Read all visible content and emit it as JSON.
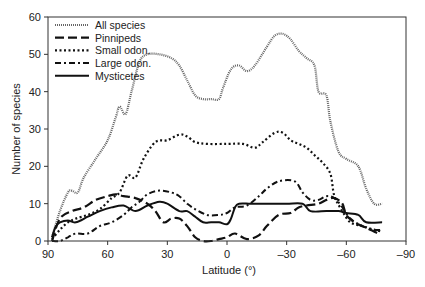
{
  "chart_data": {
    "type": "line",
    "title": "",
    "xlabel": "Latitude (°)",
    "ylabel": "Number of species",
    "xlim": [
      90,
      -90
    ],
    "ylim": [
      0,
      60
    ],
    "xticks": [
      90,
      60,
      30,
      0,
      -30,
      -60,
      -90
    ],
    "xtick_labels": [
      "90",
      "60",
      "30",
      "0",
      "–30",
      "–60",
      "–90"
    ],
    "yticks": [
      0,
      10,
      20,
      30,
      40,
      50,
      60
    ],
    "grid": false,
    "legend_position": "upper left",
    "series": [
      {
        "name": "All species",
        "style": "fine-dotted",
        "color": "#555555",
        "x": [
          88,
          84,
          80,
          78,
          75,
          72,
          66,
          60,
          56,
          54,
          51,
          48,
          44,
          40,
          34,
          28,
          24,
          20,
          16,
          12,
          8,
          4,
          2,
          -2,
          -6,
          -10,
          -14,
          -20,
          -24,
          -28,
          -32,
          -36,
          -40,
          -44,
          -46,
          -50,
          -52,
          -56,
          -60,
          -66,
          -70,
          -74,
          -78
        ],
        "y": [
          1,
          8,
          13,
          13.5,
          13,
          17,
          22,
          27,
          33,
          36,
          34,
          40,
          48,
          50,
          50,
          49,
          47,
          43,
          39,
          38,
          38,
          38,
          41,
          46,
          47,
          45.5,
          47,
          52,
          55,
          55.5,
          54,
          51,
          49,
          47,
          40,
          39,
          32,
          24,
          22,
          20,
          14,
          10,
          10
        ]
      },
      {
        "name": "Pinnipeds",
        "style": "dashed",
        "color": "#111111",
        "x": [
          88,
          84,
          78,
          72,
          66,
          60,
          56,
          52,
          46,
          40,
          36,
          32,
          28,
          24,
          20,
          16,
          12,
          8,
          4,
          0,
          -4,
          -10,
          -16,
          -20,
          -26,
          -32,
          -36,
          -40,
          -46,
          -50,
          -54,
          -58,
          -60,
          -64,
          -68,
          -72,
          -76
        ],
        "y": [
          0,
          6,
          8,
          9,
          11,
          12,
          12.5,
          12,
          11.5,
          10,
          8,
          5,
          6,
          6,
          4,
          1,
          0,
          0,
          0.5,
          1,
          2,
          0.5,
          1.5,
          4,
          7,
          7.5,
          9,
          9.5,
          10,
          11,
          11.5,
          10,
          7,
          5,
          4,
          3,
          2
        ]
      },
      {
        "name": "Small odon.",
        "style": "dotted",
        "color": "#111111",
        "x": [
          88,
          84,
          80,
          76,
          70,
          64,
          58,
          54,
          50,
          46,
          42,
          36,
          30,
          24,
          20,
          16,
          10,
          0,
          -8,
          -14,
          -18,
          -24,
          -28,
          -32,
          -36,
          -40,
          -44,
          -48,
          -52,
          -54,
          -58,
          -62,
          -68,
          -74,
          -78
        ],
        "y": [
          0.5,
          3,
          5,
          6,
          7,
          8.5,
          11.5,
          13,
          17.5,
          17,
          22,
          26.5,
          27,
          28.5,
          28,
          26.5,
          26,
          26,
          26,
          25,
          26.5,
          29,
          29,
          27,
          26,
          25,
          23,
          21,
          18,
          12,
          8,
          5,
          4,
          3,
          2.5
        ]
      },
      {
        "name": "Large odon.",
        "style": "dash-dot",
        "color": "#111111",
        "x": [
          88,
          84,
          80,
          76,
          70,
          64,
          58,
          52,
          48,
          44,
          40,
          34,
          28,
          24,
          20,
          16,
          10,
          4,
          0,
          -4,
          -10,
          -16,
          -20,
          -26,
          -34,
          -38,
          -42,
          -46,
          -50,
          -54,
          -58,
          -62,
          -68,
          -74,
          -78
        ],
        "y": [
          0,
          0,
          1,
          2,
          2,
          4,
          5,
          7,
          9,
          10.5,
          12.5,
          13.5,
          13,
          12,
          10,
          8.5,
          7,
          7,
          7.5,
          9,
          9.5,
          12,
          14,
          16,
          16,
          13,
          11,
          11,
          12,
          11.5,
          9,
          6,
          4,
          3,
          3
        ]
      },
      {
        "name": "Mysticetes",
        "style": "solid",
        "color": "#111111",
        "x": [
          88,
          86,
          84,
          80,
          76,
          70,
          64,
          58,
          52,
          46,
          40,
          34,
          30,
          24,
          20,
          16,
          12,
          8,
          4,
          0,
          -2,
          -4,
          -6,
          -12,
          -20,
          -30,
          -38,
          -42,
          -50,
          -56,
          -60,
          -66,
          -70,
          -78
        ],
        "y": [
          1,
          4,
          5,
          5.5,
          5,
          6.5,
          8,
          9,
          9.5,
          8,
          9.5,
          10.5,
          10,
          8,
          8,
          6.5,
          5,
          5,
          5,
          4.5,
          6,
          9,
          10,
          10,
          10,
          10,
          10,
          8,
          8,
          8,
          7.5,
          7,
          5,
          5
        ]
      }
    ]
  }
}
